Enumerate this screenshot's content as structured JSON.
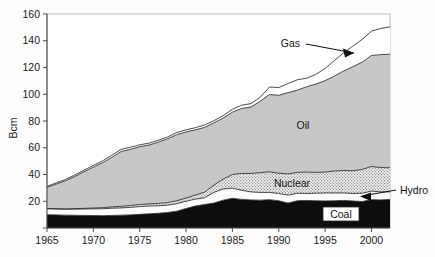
{
  "chart_data": {
    "type": "area",
    "title": "",
    "subtitle": "",
    "xlabel": "",
    "ylabel": "Bcm",
    "stacked": true,
    "grid": false,
    "legend_position": "inline-annotations",
    "xlim": [
      1965,
      2002
    ],
    "ylim": [
      0,
      160
    ],
    "ytick_values": [
      0,
      20,
      40,
      60,
      80,
      100,
      120,
      140,
      160
    ],
    "ytick_labels": [
      "",
      "20",
      "40",
      "60",
      "80",
      "100",
      "120",
      "140",
      "160"
    ],
    "xtick_values": [
      1965,
      1970,
      1975,
      1980,
      1985,
      1990,
      1995,
      2000
    ],
    "xtick_labels": [
      "1965",
      "1970",
      "1975",
      "1980",
      "1985",
      "1990",
      "1995",
      "2000"
    ],
    "x": [
      1965,
      1966,
      1967,
      1968,
      1969,
      1970,
      1971,
      1972,
      1973,
      1974,
      1975,
      1976,
      1977,
      1978,
      1979,
      1980,
      1981,
      1982,
      1983,
      1984,
      1985,
      1986,
      1987,
      1988,
      1989,
      1990,
      1991,
      1992,
      1993,
      1994,
      1995,
      1996,
      1997,
      1998,
      1999,
      2000,
      2001,
      2002
    ],
    "series": [
      {
        "name": "Coal",
        "fill": "#0d0d0d",
        "pattern": "solid-black",
        "values": [
          10.0,
          9.8,
          9.6,
          9.5,
          9.4,
          9.3,
          9.2,
          9.4,
          9.6,
          9.8,
          10.2,
          10.6,
          11.0,
          11.6,
          12.6,
          14.6,
          16.4,
          17.6,
          18.6,
          20.8,
          22.2,
          21.4,
          21.0,
          20.8,
          21.2,
          20.4,
          18.6,
          20.4,
          20.6,
          20.4,
          20.2,
          20.4,
          20.6,
          20.2,
          19.8,
          21.2,
          21.0,
          21.4
        ]
      },
      {
        "name": "Hydro",
        "fill": "#fbfbfb",
        "pattern": "near-white",
        "values": [
          4.4,
          4.4,
          4.4,
          4.6,
          4.8,
          5.0,
          5.2,
          5.4,
          5.4,
          5.6,
          5.8,
          5.8,
          5.6,
          5.4,
          5.6,
          5.4,
          5.2,
          5.0,
          8.0,
          8.4,
          7.6,
          6.8,
          6.0,
          5.8,
          5.4,
          5.4,
          6.0,
          5.6,
          5.2,
          5.6,
          6.0,
          5.8,
          5.6,
          5.6,
          6.2,
          6.4,
          6.0,
          5.6
        ]
      },
      {
        "name": "Nuclear",
        "fill": "#d8d8d8",
        "pattern": "stipple",
        "values": [
          0.2,
          0.2,
          0.3,
          0.4,
          0.5,
          0.6,
          0.8,
          1.0,
          1.2,
          1.4,
          1.6,
          1.6,
          1.8,
          2.0,
          2.2,
          2.4,
          3.0,
          4.2,
          5.4,
          7.4,
          10.2,
          12.6,
          13.8,
          14.8,
          15.4,
          15.2,
          15.8,
          15.6,
          16.0,
          15.6,
          15.6,
          16.4,
          16.8,
          17.0,
          17.8,
          18.4,
          18.2,
          18.0
        ]
      },
      {
        "name": "Oil",
        "fill": "#c7c7c7",
        "pattern": "light-gray",
        "values": [
          15.8,
          18.4,
          21.0,
          24.0,
          27.4,
          30.6,
          33.6,
          37.0,
          41.0,
          42.0,
          43.2,
          44.0,
          45.8,
          47.6,
          49.4,
          49.4,
          48.8,
          48.4,
          46.6,
          45.6,
          46.6,
          48.6,
          49.6,
          53.4,
          57.8,
          58.2,
          60.8,
          61.4,
          63.8,
          66.0,
          68.4,
          71.0,
          74.4,
          77.8,
          80.2,
          83.0,
          84.4,
          85.0
        ]
      },
      {
        "name": "Gas",
        "fill": "#ffffff",
        "pattern": "white",
        "values": [
          0.8,
          0.9,
          1.0,
          1.1,
          1.2,
          1.3,
          1.4,
          1.6,
          1.6,
          1.6,
          1.4,
          1.4,
          1.4,
          1.4,
          1.6,
          1.6,
          1.6,
          1.8,
          1.6,
          1.8,
          2.2,
          2.4,
          2.6,
          3.0,
          5.6,
          5.8,
          6.8,
          7.8,
          6.4,
          7.2,
          9.2,
          11.6,
          13.6,
          15.4,
          17.0,
          18.2,
          19.6,
          20.4
        ]
      }
    ],
    "annotations": [
      {
        "name": "gas-label",
        "text": "Gas",
        "arrow": true,
        "arrow_direction": "right"
      },
      {
        "name": "oil-label",
        "text": "Oil",
        "arrow": false
      },
      {
        "name": "nuclear-label",
        "text": "Nuclear",
        "arrow": false
      },
      {
        "name": "hydro-label",
        "text": "Hydro",
        "arrow": true,
        "arrow_direction": "left"
      },
      {
        "name": "coal-label",
        "text": "Coal",
        "arrow": false,
        "boxed": true
      }
    ]
  },
  "colors": {
    "coal": "#0d0d0d",
    "hydro": "#fbfbfb",
    "nuclear": "#d8d8d8",
    "oil": "#c7c7c7",
    "gas": "#ffffff",
    "axis": "#4d4d4d",
    "text": "#1a1a1a",
    "background": "#fdfdfd"
  }
}
